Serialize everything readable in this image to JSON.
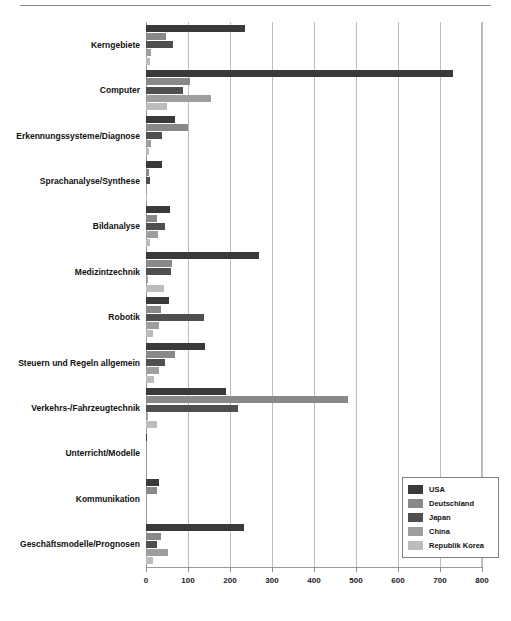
{
  "chart_data": {
    "type": "bar",
    "orientation": "horizontal",
    "title": "",
    "subtitle": "",
    "xlabel": "",
    "ylabel": "",
    "xlim": [
      0,
      800
    ],
    "xticks": [
      0,
      100,
      200,
      300,
      400,
      500,
      600,
      700,
      800
    ],
    "xtick_labels": [
      "0",
      "100",
      "200",
      "300",
      "400",
      "500",
      "600",
      "700",
      "800"
    ],
    "grid": true,
    "legend_position": "bottom-right",
    "categories": [
      "Kerngebiete",
      "Computer",
      "Erkennungssysteme/Diagnose",
      "Sprachanalyse/Synthese",
      "Bildanalyse",
      "Medizintzechnik",
      "Robotik",
      "Steuern und Regeln allgemein",
      "Verkehrs-/Fahrzeugtechnik",
      "Unterricht/Modelle",
      "Kommunikation",
      "Geschäftsmodelle/Prognosen"
    ],
    "series": [
      {
        "name": "USA",
        "color": "#3a3a3a",
        "values": [
          236,
          730,
          70,
          38,
          57,
          270,
          55,
          140,
          190,
          3,
          30,
          233
        ]
      },
      {
        "name": "Deutschland",
        "color": "#898989",
        "values": [
          47,
          105,
          100,
          6,
          25,
          63,
          36,
          68,
          480,
          0,
          27,
          35
        ]
      },
      {
        "name": "Japan",
        "color": "#4f4f4f",
        "values": [
          65,
          88,
          37,
          9,
          45,
          60,
          137,
          45,
          220,
          0,
          0,
          26
        ]
      },
      {
        "name": "China",
        "color": "#9e9e9e",
        "values": [
          12,
          155,
          13,
          3,
          28,
          5,
          30,
          30,
          4,
          0,
          0,
          52
        ]
      },
      {
        "name": "Republik Korea",
        "color": "#bcbcbc",
        "values": [
          10,
          50,
          6,
          1,
          10,
          42,
          16,
          20,
          25,
          0,
          0,
          17
        ]
      }
    ]
  },
  "legend": {
    "items": [
      {
        "label": "USA",
        "color": "#3a3a3a"
      },
      {
        "label": "Deutschland",
        "color": "#898989"
      },
      {
        "label": "Japan",
        "color": "#4f4f4f"
      },
      {
        "label": "China",
        "color": "#9e9e9e"
      },
      {
        "label": "Republik Korea",
        "color": "#bcbcbc"
      }
    ]
  }
}
